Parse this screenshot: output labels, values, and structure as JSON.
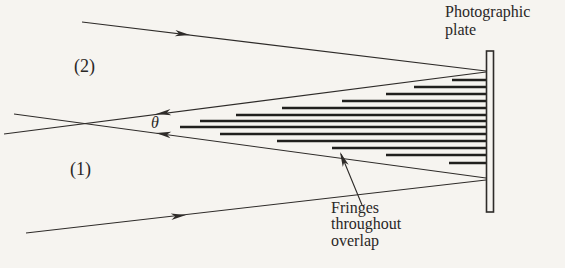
{
  "figure": {
    "background": "#f6f4f0",
    "ink": "#2e2b29",
    "fringe_ink": "#21201e",
    "labels": {
      "photographic_plate": "Photographic\nplate",
      "beam2": "(2)",
      "beam1": "(1)",
      "theta": "θ",
      "fringes_caption": "Fringes\nthroughout\noverlap"
    },
    "diagram": {
      "plate": {
        "x": 486.5,
        "y": 51,
        "width": 7,
        "height": 161
      },
      "beam_edges": [
        {
          "name": "beam2-upper-edge",
          "x1": 82,
          "y1": 22,
          "x2": 486,
          "y2": 71
        },
        {
          "name": "beam2-lower-edge",
          "x1": 14,
          "y1": 114,
          "x2": 486,
          "y2": 178
        },
        {
          "name": "beam1-upper-edge",
          "x1": 4,
          "y1": 134,
          "x2": 486,
          "y2": 72
        },
        {
          "name": "beam1-lower-edge",
          "x1": 26,
          "y1": 233,
          "x2": 486,
          "y2": 180
        }
      ],
      "pointer_line": {
        "name": "fringes-pointer-line",
        "x1": 362,
        "y1": 205,
        "x2": 341,
        "y2": 154
      },
      "arrows": [
        {
          "name": "beam2-direction-arrow",
          "x": 190,
          "y": 35,
          "angle": 7.1
        },
        {
          "name": "beam1-direction-arrow",
          "x": 186,
          "y": 215,
          "angle": -6.6
        },
        {
          "name": "theta-upper-arrow",
          "x": 156,
          "y": 114,
          "angle": 172.6
        },
        {
          "name": "theta-lower-arrow",
          "x": 156,
          "y": 133,
          "angle": 187.7
        },
        {
          "name": "fringes-pointer-arrow",
          "x": 340,
          "y": 152,
          "angle": -112.5
        }
      ],
      "fringes": {
        "x_end": 486,
        "stroke_width": 2.4,
        "rows": [
          {
            "y": 80,
            "x": 452
          },
          {
            "y": 87,
            "x": 414
          },
          {
            "y": 94,
            "x": 386
          },
          {
            "y": 101,
            "x": 342
          },
          {
            "y": 108,
            "x": 282
          },
          {
            "y": 115,
            "x": 236
          },
          {
            "y": 121,
            "x": 200
          },
          {
            "y": 127,
            "x": 180
          },
          {
            "y": 134,
            "x": 220
          },
          {
            "y": 141,
            "x": 277
          },
          {
            "y": 148,
            "x": 332
          },
          {
            "y": 155,
            "x": 386
          },
          {
            "y": 163,
            "x": 449
          }
        ]
      }
    }
  }
}
